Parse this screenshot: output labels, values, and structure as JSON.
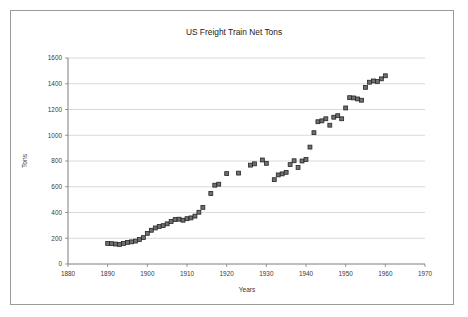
{
  "chart_data": {
    "type": "scatter",
    "title": "US Freight Train Net Tons",
    "xlabel": "Years",
    "ylabel": "Tons",
    "xlim": [
      1880,
      1970
    ],
    "ylim": [
      0,
      1600
    ],
    "xticks": [
      1880,
      1890,
      1900,
      1910,
      1920,
      1930,
      1940,
      1950,
      1960,
      1970
    ],
    "yticks": [
      0,
      200,
      400,
      600,
      800,
      1000,
      1200,
      1400,
      1600
    ],
    "grid": "horizontal",
    "legend": "none",
    "marker": "square",
    "marker_color": "#6f6f6f",
    "marker_edge_color": "#262626",
    "series": [
      {
        "name": "US Freight Train Net Tons",
        "points": [
          [
            1890,
            160
          ],
          [
            1891,
            158
          ],
          [
            1892,
            155
          ],
          [
            1893,
            152
          ],
          [
            1894,
            160
          ],
          [
            1895,
            168
          ],
          [
            1896,
            172
          ],
          [
            1897,
            178
          ],
          [
            1898,
            190
          ],
          [
            1899,
            205
          ],
          [
            1900,
            238
          ],
          [
            1901,
            262
          ],
          [
            1902,
            280
          ],
          [
            1903,
            292
          ],
          [
            1904,
            298
          ],
          [
            1905,
            312
          ],
          [
            1906,
            330
          ],
          [
            1907,
            345
          ],
          [
            1908,
            348
          ],
          [
            1909,
            340
          ],
          [
            1910,
            352
          ],
          [
            1911,
            358
          ],
          [
            1912,
            372
          ],
          [
            1913,
            402
          ],
          [
            1914,
            440
          ],
          [
            1916,
            548
          ],
          [
            1917,
            612
          ],
          [
            1918,
            620
          ],
          [
            1920,
            702
          ],
          [
            1923,
            706
          ],
          [
            1926,
            768
          ],
          [
            1927,
            778
          ],
          [
            1929,
            808
          ],
          [
            1930,
            782
          ],
          [
            1932,
            655
          ],
          [
            1933,
            692
          ],
          [
            1934,
            700
          ],
          [
            1935,
            712
          ],
          [
            1936,
            772
          ],
          [
            1937,
            802
          ],
          [
            1938,
            750
          ],
          [
            1939,
            800
          ],
          [
            1940,
            812
          ],
          [
            1941,
            908
          ],
          [
            1942,
            1020
          ],
          [
            1943,
            1105
          ],
          [
            1944,
            1112
          ],
          [
            1945,
            1128
          ],
          [
            1946,
            1078
          ],
          [
            1947,
            1140
          ],
          [
            1948,
            1152
          ],
          [
            1949,
            1128
          ],
          [
            1950,
            1212
          ],
          [
            1951,
            1292
          ],
          [
            1952,
            1290
          ],
          [
            1953,
            1282
          ],
          [
            1954,
            1272
          ],
          [
            1955,
            1372
          ],
          [
            1956,
            1412
          ],
          [
            1957,
            1422
          ],
          [
            1958,
            1418
          ],
          [
            1959,
            1438
          ],
          [
            1960,
            1462
          ]
        ]
      }
    ]
  }
}
